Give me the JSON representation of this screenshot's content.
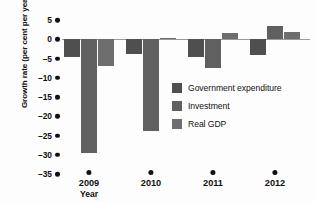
{
  "chart_data": {
    "type": "bar",
    "title": "",
    "subtitle": "",
    "xlabel": "Year",
    "ylabel": "Growth rate (per cent per year)",
    "categories": [
      "2009",
      "2010",
      "2011",
      "2012"
    ],
    "ylim": [
      -35,
      5
    ],
    "yticks": [
      5,
      0,
      -5,
      -10,
      -15,
      -20,
      -25,
      -30,
      -35
    ],
    "ytick_labels": [
      "5",
      "0",
      "–5",
      "–10",
      "–15",
      "–20",
      "–25",
      "–30",
      "–35"
    ],
    "grid": false,
    "legend_position": "center-right",
    "series": [
      {
        "name": "Government expenditure",
        "color": "#4f4f4f",
        "values": [
          -4.5,
          -3.8,
          -4.5,
          -4.0
        ]
      },
      {
        "name": "Investment",
        "color": "#606060",
        "values": [
          -29.5,
          -23.8,
          -7.5,
          3.5
        ]
      },
      {
        "name": "Real GDP",
        "color": "#6e6e6e",
        "values": [
          -7.0,
          0.3,
          1.5,
          2.0
        ]
      }
    ]
  },
  "axis": {
    "y_title": "Growth rate (per cent per year)",
    "x_title": "Year"
  },
  "legend": {
    "items": [
      {
        "label": "Government expenditure",
        "color": "#4f4f4f"
      },
      {
        "label": "Investment",
        "color": "#606060"
      },
      {
        "label": "Real GDP",
        "color": "#6e6e6e"
      }
    ]
  },
  "colors": {
    "background": "#fdfdfd",
    "axis_line": "#9a9a9a",
    "text": "#111111"
  }
}
